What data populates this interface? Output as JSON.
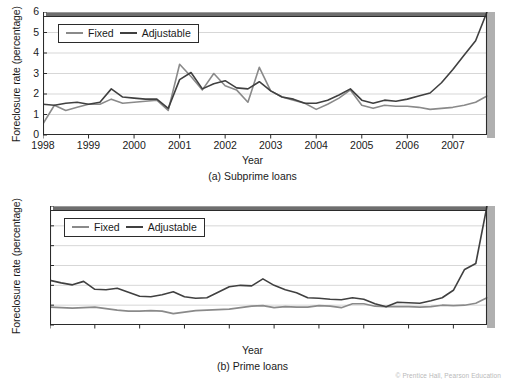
{
  "figure": {
    "footnote": "© Prentice Hall, Pearson Education"
  },
  "charts": [
    {
      "id": "subprime",
      "caption": "(a) Subprime loans",
      "ylabel": "Foreclosure rate (percentage)",
      "xlabel": "Year",
      "legend": [
        {
          "label": "Fixed",
          "color": "#8a8a8a"
        },
        {
          "label": "Adjustable",
          "color": "#404040"
        }
      ],
      "yticks": [
        "0",
        "1",
        "2",
        "3",
        "4",
        "5",
        "6"
      ],
      "xticks": [
        "1998",
        "1999",
        "2000",
        "2001",
        "2002",
        "2003",
        "2004",
        "2005",
        "2006",
        "2007"
      ]
    },
    {
      "id": "prime",
      "caption": "(b) Prime loans",
      "ylabel": "Foreclosure rate (percentage)",
      "xlabel": "Year",
      "legend": [
        {
          "label": "Fixed",
          "color": "#8a8a8a"
        },
        {
          "label": "Adjustable",
          "color": "#404040"
        }
      ],
      "yticks": [
        "0",
        "0.2",
        "0.4",
        "0.6",
        "0.8",
        "1",
        "1.2"
      ],
      "xticks": [
        "1998",
        "1999",
        "2000",
        "2001",
        "2002",
        "2003",
        "2004",
        "2005",
        "2006",
        "2007"
      ]
    }
  ],
  "chart_data": [
    {
      "type": "line",
      "title": "(a) Subprime loans",
      "xlabel": "Year",
      "ylabel": "Foreclosure rate (percentage)",
      "xlim": [
        1998.0,
        2007.75
      ],
      "ylim": [
        0,
        6
      ],
      "yticks": [
        0,
        1,
        2,
        3,
        4,
        5,
        6
      ],
      "xticks": [
        1998,
        1999,
        2000,
        2001,
        2002,
        2003,
        2004,
        2005,
        2006,
        2007
      ],
      "grid": "horizontal",
      "legend_position": "top-left",
      "x": [
        1998.0,
        1998.25,
        1998.5,
        1998.75,
        1999.0,
        1999.25,
        1999.5,
        1999.75,
        2000.0,
        2000.25,
        2000.5,
        2000.75,
        2001.0,
        2001.25,
        2001.5,
        2001.75,
        2002.0,
        2002.25,
        2002.5,
        2002.75,
        2003.0,
        2003.25,
        2003.5,
        2003.75,
        2004.0,
        2004.25,
        2004.5,
        2004.75,
        2005.0,
        2005.25,
        2005.5,
        2005.75,
        2006.0,
        2006.25,
        2006.5,
        2006.75,
        2007.0,
        2007.25,
        2007.5,
        2007.75
      ],
      "series": [
        {
          "name": "Fixed",
          "color": "#8a8a8a",
          "values": [
            0.55,
            1.45,
            1.2,
            1.35,
            1.5,
            1.5,
            1.75,
            1.55,
            1.6,
            1.65,
            1.7,
            1.2,
            3.45,
            2.85,
            2.2,
            3.0,
            2.4,
            2.2,
            1.6,
            3.3,
            2.15,
            1.85,
            1.7,
            1.55,
            1.25,
            1.5,
            1.8,
            2.2,
            1.45,
            1.3,
            1.45,
            1.4,
            1.4,
            1.35,
            1.25,
            1.3,
            1.35,
            1.45,
            1.6,
            1.9
          ]
        },
        {
          "name": "Adjustable",
          "color": "#404040",
          "values": [
            1.5,
            1.45,
            1.55,
            1.6,
            1.5,
            1.6,
            2.25,
            1.85,
            1.8,
            1.75,
            1.75,
            1.3,
            2.7,
            3.05,
            2.25,
            2.5,
            2.65,
            2.3,
            2.25,
            2.6,
            2.15,
            1.85,
            1.75,
            1.55,
            1.55,
            1.7,
            1.95,
            2.25,
            1.7,
            1.55,
            1.7,
            1.65,
            1.75,
            1.9,
            2.05,
            2.55,
            3.2,
            3.9,
            4.6,
            6.0
          ]
        }
      ]
    },
    {
      "type": "line",
      "title": "(b) Prime loans",
      "xlabel": "Year",
      "ylabel": "Foreclosure rate (percentage)",
      "xlim": [
        1998.0,
        2007.75
      ],
      "ylim": [
        0,
        1.2
      ],
      "yticks": [
        0,
        0.2,
        0.4,
        0.6,
        0.8,
        1.0,
        1.2
      ],
      "xticks": [
        1998,
        1999,
        2000,
        2001,
        2002,
        2003,
        2004,
        2005,
        2006,
        2007
      ],
      "grid": "horizontal",
      "legend_position": "top-left",
      "x": [
        1998.0,
        1998.25,
        1998.5,
        1998.75,
        1999.0,
        1999.25,
        1999.5,
        1999.75,
        2000.0,
        2000.25,
        2000.5,
        2000.75,
        2001.0,
        2001.25,
        2001.5,
        2001.75,
        2002.0,
        2002.25,
        2002.5,
        2002.75,
        2003.0,
        2003.25,
        2003.5,
        2003.75,
        2004.0,
        2004.25,
        2004.5,
        2004.75,
        2005.0,
        2005.25,
        2005.5,
        2005.75,
        2006.0,
        2006.25,
        2006.5,
        2006.75,
        2007.0,
        2007.25,
        2007.5,
        2007.75
      ],
      "series": [
        {
          "name": "Fixed",
          "color": "#8a8a8a",
          "values": [
            0.18,
            0.175,
            0.17,
            0.175,
            0.18,
            0.165,
            0.15,
            0.14,
            0.14,
            0.145,
            0.14,
            0.115,
            0.13,
            0.145,
            0.15,
            0.155,
            0.16,
            0.175,
            0.19,
            0.195,
            0.175,
            0.185,
            0.18,
            0.18,
            0.195,
            0.19,
            0.175,
            0.215,
            0.215,
            0.19,
            0.185,
            0.185,
            0.185,
            0.18,
            0.185,
            0.2,
            0.195,
            0.2,
            0.22,
            0.275
          ]
        },
        {
          "name": "Adjustable",
          "color": "#404040",
          "values": [
            0.45,
            0.425,
            0.405,
            0.44,
            0.36,
            0.355,
            0.37,
            0.33,
            0.29,
            0.285,
            0.305,
            0.335,
            0.285,
            0.27,
            0.275,
            0.33,
            0.385,
            0.4,
            0.395,
            0.465,
            0.4,
            0.355,
            0.325,
            0.275,
            0.27,
            0.26,
            0.255,
            0.275,
            0.26,
            0.215,
            0.185,
            0.23,
            0.225,
            0.22,
            0.245,
            0.275,
            0.35,
            0.56,
            0.62,
            1.2
          ]
        }
      ]
    }
  ]
}
